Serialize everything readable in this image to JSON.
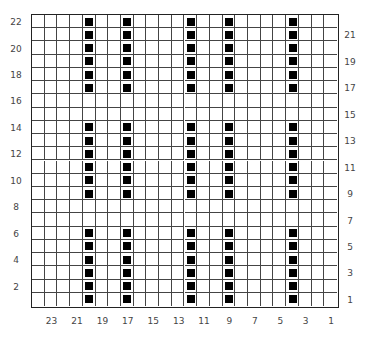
{
  "chart": {
    "columns": 24,
    "rows": 22,
    "grid_color": "#444444",
    "stitch_color": "#000000",
    "filled_columns": [
      20,
      17,
      12,
      9,
      4
    ],
    "filled_rows": [
      1,
      2,
      3,
      4,
      5,
      6,
      9,
      10,
      11,
      12,
      13,
      14,
      17,
      18,
      19,
      20,
      21,
      22
    ],
    "left_row_labels": [
      "22",
      "20",
      "18",
      "16",
      "14",
      "12",
      "10",
      "8",
      "6",
      "4",
      "2"
    ],
    "right_row_labels": [
      "21",
      "19",
      "17",
      "15",
      "13",
      "11",
      "9",
      "7",
      "5",
      "3",
      "1"
    ],
    "bottom_column_labels": [
      "23",
      "21",
      "19",
      "17",
      "15",
      "13",
      "11",
      "9",
      "7",
      "5",
      "3",
      "1"
    ]
  }
}
